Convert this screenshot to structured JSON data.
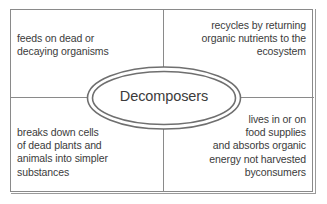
{
  "diagram": {
    "kind": "concept-map",
    "center": {
      "label": "Decomposers",
      "shape": "double-ellipse"
    },
    "quadrants": {
      "top_left": "feeds on dead or\ndecaying organisms",
      "top_right": "recycles by returning\norganic nutrients to the\necosystem",
      "bottom_left": "breaks down cells\nof dead plants and\nanimals into simpler\nsubstances",
      "bottom_right": "lives in or on\nfood supplies\nand absorbs organic\nenergy not harvested\nbyconsumers"
    },
    "colors": {
      "text": "#3b3b3b",
      "line": "#8a8a8a",
      "background": "#ffffff"
    }
  }
}
